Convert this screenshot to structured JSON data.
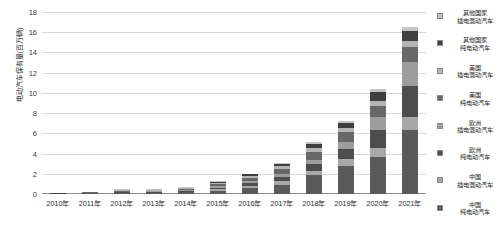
{
  "chart_data": {
    "type": "bar",
    "stacked": true,
    "title": "",
    "xlabel": "",
    "ylabel": "电动汽车保有量(百万辆)",
    "ylim": [
      0,
      18
    ],
    "ytick_step": 2,
    "yticks": [
      "0",
      "2",
      "4",
      "6",
      "8",
      "10",
      "12",
      "14",
      "16",
      "18"
    ],
    "grid": true,
    "legend_position": "right",
    "categories": [
      "2010年",
      "2011年",
      "2012年",
      "2013年",
      "2014年",
      "2015年",
      "2016年",
      "2017年",
      "2018年",
      "2019年",
      "2020年",
      "2021年"
    ],
    "series": [
      {
        "name": "中国纯电动汽车",
        "name_line1": "中国",
        "name_line2": "纯电动汽车",
        "color": "#5a5a5a",
        "values": [
          0.0,
          0.01,
          0.03,
          0.08,
          0.15,
          0.32,
          0.55,
          0.9,
          1.85,
          2.75,
          3.7,
          6.3
        ]
      },
      {
        "name": "中国插电混动汽车",
        "name_line1": "中国",
        "name_line2": "插电混动汽车",
        "color": "#a8a8a8",
        "values": [
          0.0,
          0.0,
          0.01,
          0.02,
          0.05,
          0.13,
          0.22,
          0.35,
          0.45,
          0.7,
          0.85,
          1.3
        ]
      },
      {
        "name": "欧洲纯电动汽车",
        "name_line1": "欧洲",
        "name_line2": "纯电动汽车",
        "color": "#4d4d4d",
        "values": [
          0.0,
          0.01,
          0.02,
          0.05,
          0.1,
          0.18,
          0.3,
          0.45,
          0.65,
          1.0,
          1.8,
          3.1
        ]
      },
      {
        "name": "欧洲插电混动汽车",
        "name_line1": "欧洲",
        "name_line2": "插电混动汽车",
        "color": "#9d9d9d",
        "values": [
          0.0,
          0.0,
          0.01,
          0.02,
          0.05,
          0.12,
          0.2,
          0.3,
          0.45,
          0.7,
          1.25,
          2.35
        ]
      },
      {
        "name": "美国纯电动汽车",
        "name_line1": "美国",
        "name_line2": "纯电动汽车",
        "color": "#686868",
        "values": [
          0.0,
          0.01,
          0.02,
          0.05,
          0.12,
          0.22,
          0.35,
          0.48,
          0.75,
          0.95,
          1.1,
          1.45
        ]
      },
      {
        "name": "美国插电混动汽车",
        "name_line1": "美国",
        "name_line2": "插电混动汽车",
        "color": "#b4b4b4",
        "values": [
          0.0,
          0.0,
          0.01,
          0.03,
          0.08,
          0.14,
          0.2,
          0.28,
          0.4,
          0.48,
          0.55,
          0.65
        ]
      },
      {
        "name": "其他国家纯电动汽车",
        "name_line1": "其他国家",
        "name_line2": "纯电动汽车",
        "color": "#3f3f3f",
        "values": [
          0.01,
          0.01,
          0.01,
          0.03,
          0.08,
          0.1,
          0.12,
          0.22,
          0.4,
          0.48,
          0.85,
          1.0
        ]
      },
      {
        "name": "其他国家插电混动汽车",
        "name_line1": "其他国家",
        "name_line2": "插电混动汽车",
        "color": "#c4c4c4",
        "values": [
          0.0,
          0.0,
          0.01,
          0.02,
          0.02,
          0.04,
          0.06,
          0.12,
          0.15,
          0.14,
          0.3,
          0.35
        ]
      }
    ],
    "totals": [
      0.01,
      0.04,
      0.12,
      0.3,
      0.65,
      1.25,
      2.0,
      3.1,
      5.1,
      7.2,
      10.4,
      16.5
    ]
  }
}
